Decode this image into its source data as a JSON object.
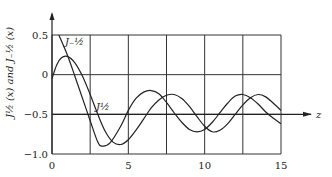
{
  "chart_data": {
    "type": "line",
    "title": "",
    "xlabel": "z",
    "ylabel": "J_{1/2}(x) and J_{-1/2}(x)",
    "xlim": [
      0,
      15
    ],
    "ylim": [
      -1.0,
      0.5
    ],
    "xticks": [
      0,
      5,
      10,
      15
    ],
    "xtick_labels": [
      "0",
      "5",
      "10",
      "15"
    ],
    "yticks": [
      0.5,
      0,
      -0.5,
      -1.0
    ],
    "ytick_labels": [
      "0.5",
      "0",
      "−0.5",
      "−1.0"
    ],
    "grid": true,
    "x_gridlines": [
      0,
      2.5,
      5,
      7.5,
      10,
      12.5,
      15
    ],
    "y_gridlines": [
      0.5,
      0,
      -0.5,
      -1.0
    ],
    "z_axis_at_y": -0.5,
    "series": [
      {
        "name": "J_{-1/2}",
        "label": "J₋½",
        "x": [
          0.45,
          1,
          1.5,
          2,
          2.5,
          3,
          3.3,
          3.8,
          4.5,
          5,
          5.5,
          6,
          6.5,
          7,
          7.5,
          8,
          8.5,
          9,
          9.5,
          10,
          10.5,
          11,
          11.5,
          12,
          12.5,
          13,
          13.5,
          14,
          14.5,
          15
        ],
        "y": [
          0.5,
          0.25,
          -0.02,
          -0.3,
          -0.58,
          -0.85,
          -0.9,
          -0.86,
          -0.65,
          -0.45,
          -0.3,
          -0.22,
          -0.2,
          -0.24,
          -0.35,
          -0.48,
          -0.6,
          -0.69,
          -0.72,
          -0.69,
          -0.6,
          -0.48,
          -0.36,
          -0.27,
          -0.25,
          -0.29,
          -0.37,
          -0.47,
          -0.55,
          -0.62
        ]
      },
      {
        "name": "J_{1/2}",
        "label": "J½",
        "x": [
          0,
          0.3,
          0.6,
          1,
          1.5,
          2,
          2.5,
          3,
          3.5,
          4,
          4.5,
          5,
          5.5,
          6,
          6.5,
          7,
          7.5,
          8,
          8.5,
          9,
          9.5,
          10,
          10.5,
          11,
          11.5,
          12,
          12.5,
          13,
          13.5,
          14,
          14.5,
          15
        ],
        "y": [
          -0.05,
          0.12,
          0.21,
          0.23,
          0.15,
          -0.02,
          -0.25,
          -0.5,
          -0.72,
          -0.85,
          -0.88,
          -0.82,
          -0.7,
          -0.56,
          -0.42,
          -0.32,
          -0.26,
          -0.25,
          -0.3,
          -0.4,
          -0.53,
          -0.65,
          -0.72,
          -0.7,
          -0.62,
          -0.5,
          -0.38,
          -0.29,
          -0.25,
          -0.28,
          -0.36,
          -0.45
        ]
      }
    ]
  },
  "labels": {
    "y_axis_title": "J½ (x) and J₋½ (x)",
    "x_axis_label": "z",
    "curve_label_1": "J₋½",
    "curve_label_2": "J½"
  }
}
